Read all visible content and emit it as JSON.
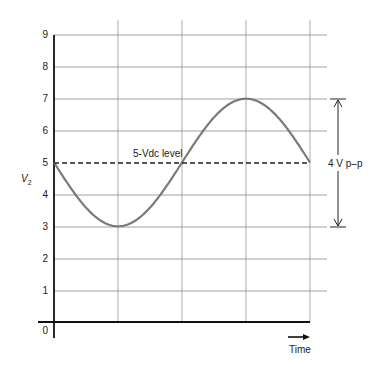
{
  "chart_data": {
    "type": "line",
    "title": "",
    "xlabel": "Time",
    "ylabel": "V2",
    "ylim": [
      0,
      9
    ],
    "yticks": [
      0,
      1,
      2,
      3,
      4,
      5,
      6,
      7,
      8,
      9
    ],
    "grid": true,
    "x_divisions": 4,
    "series": [
      {
        "name": "V2 waveform",
        "description": "Inverted sine wave centered at 5 V, 2 V amplitude, one full period",
        "x": [
          0,
          0.5,
          1,
          1.5,
          2,
          2.5,
          3,
          3.5,
          4
        ],
        "values": [
          5,
          3.59,
          3,
          3.59,
          5,
          6.41,
          7,
          6.41,
          5
        ],
        "color": "#7a7a7a"
      },
      {
        "name": "5-Vdc level",
        "x": [
          0,
          4
        ],
        "values": [
          5,
          5
        ],
        "style": "dashed",
        "color": "#222222"
      }
    ],
    "annotations": [
      {
        "text": "5-Vdc level",
        "at": [
          1.3,
          5.3
        ]
      },
      {
        "text": "4 V p–p",
        "description": "double-headed arrow spanning 3 V to 7 V"
      }
    ]
  },
  "labels": {
    "y_axis": "V",
    "y_axis_sub": "2",
    "x_axis": "Time",
    "dc_level": "5-Vdc level",
    "pp": "4 V p–p",
    "origin": "0",
    "ticks": [
      "1",
      "2",
      "3",
      "4",
      "5",
      "6",
      "7",
      "8",
      "9"
    ]
  }
}
